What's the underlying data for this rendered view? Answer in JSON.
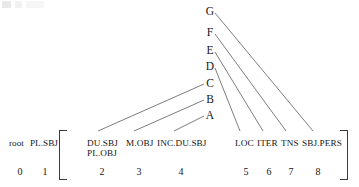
{
  "figure": {
    "title_artifact": "",
    "background_color": "#ffffff",
    "line_color": "#6e6e6e",
    "text_color": "#161616",
    "bracket_color": "#3b3b3b"
  },
  "nodes": [
    {
      "label": "G",
      "x": 208,
      "y": 11
    },
    {
      "label": "F",
      "x": 208,
      "y": 32
    },
    {
      "label": "E",
      "x": 208,
      "y": 50
    },
    {
      "label": "D",
      "x": 208,
      "y": 66
    },
    {
      "label": "C",
      "x": 208,
      "y": 83
    },
    {
      "label": "B",
      "x": 208,
      "y": 99
    },
    {
      "label": "A",
      "x": 208,
      "y": 115
    }
  ],
  "outer_slots": [
    {
      "label": "root",
      "index": "0",
      "x": 9,
      "ix": 13
    },
    {
      "label": "PL.SBJ",
      "index": "1",
      "x": 30,
      "ix": 38
    }
  ],
  "inner_slots": [
    {
      "label": "DU.SBJ",
      "sub": "PL.OBJ",
      "index": "2",
      "x": 87,
      "ix": 95
    },
    {
      "label": "M.OBJ",
      "sub": "",
      "index": "3",
      "x": 126,
      "ix": 132
    },
    {
      "label": "INC.DU.SBJ",
      "sub": "",
      "index": "4",
      "x": 157,
      "ix": 174
    },
    {
      "label": "LOC",
      "sub": "",
      "index": "5",
      "x": 235,
      "ix": 239
    },
    {
      "label": "ITER",
      "sub": "",
      "index": "6",
      "x": 257,
      "ix": 262
    },
    {
      "label": "TNS",
      "sub": "",
      "index": "7",
      "x": 281,
      "ix": 284
    },
    {
      "label": "SBJ.PERS",
      "sub": "",
      "index": "8",
      "x": 302,
      "ix": 311
    }
  ],
  "connections": [
    {
      "from": "C",
      "to": "2",
      "x1": 204,
      "y1": 84,
      "x2": 98,
      "y2": 131
    },
    {
      "from": "B",
      "to": "3",
      "x1": 204,
      "y1": 100,
      "x2": 134,
      "y2": 131
    },
    {
      "from": "A",
      "to": "4",
      "x1": 204,
      "y1": 116,
      "x2": 174,
      "y2": 131
    },
    {
      "from": "D",
      "to": "5",
      "x1": 215,
      "y1": 68,
      "x2": 240,
      "y2": 131
    },
    {
      "from": "E",
      "to": "6",
      "x1": 215,
      "y1": 52,
      "x2": 263,
      "y2": 131
    },
    {
      "from": "F",
      "to": "7",
      "x1": 215,
      "y1": 34,
      "x2": 286,
      "y2": 131
    },
    {
      "from": "G",
      "to": "8",
      "x1": 215,
      "y1": 13,
      "x2": 313,
      "y2": 131
    }
  ],
  "brackets": {
    "left_symbol": "[",
    "right_symbol": "]"
  }
}
